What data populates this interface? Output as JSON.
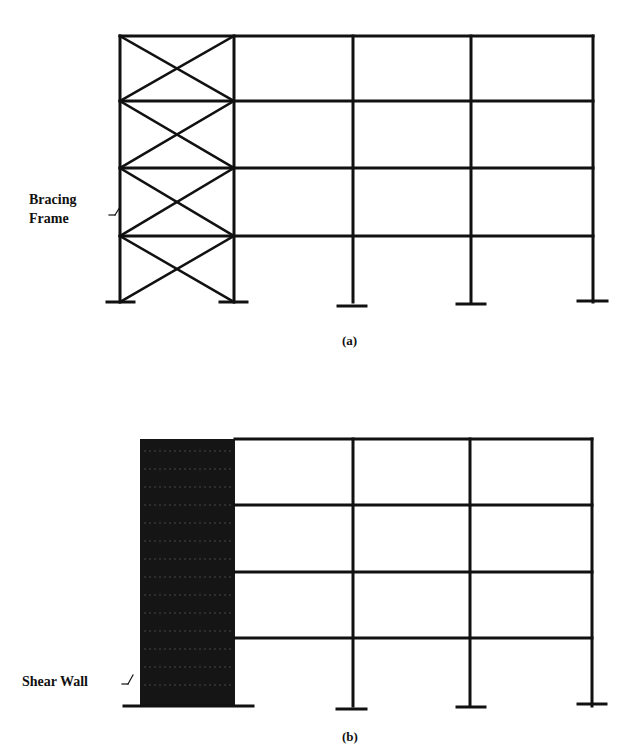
{
  "figure": {
    "stroke_color": "#111111",
    "background": "#ffffff",
    "panel_a": {
      "caption": "(a)",
      "label": {
        "line1": "Bracing",
        "line2": "Frame"
      },
      "system": "Bracing Frame",
      "stories": 4,
      "bays": 4,
      "columns_x": [
        120,
        234,
        353,
        471,
        593
      ],
      "beams_y": [
        36,
        101,
        168,
        236
      ],
      "base_y": 302,
      "braced_bay": {
        "x1": 120,
        "x2": 234
      },
      "footings": [
        {
          "x1": 107,
          "x2": 134,
          "y": 302
        },
        {
          "x1": 220,
          "x2": 247,
          "y": 302
        },
        {
          "x1": 338,
          "x2": 366,
          "y": 306
        },
        {
          "x1": 457,
          "x2": 485,
          "y": 304
        },
        {
          "x1": 578,
          "x2": 607,
          "y": 301
        }
      ],
      "leader": {
        "x1": 115,
        "y1": 215,
        "x2": 120,
        "y2": 207
      }
    },
    "panel_b": {
      "caption": "(b)",
      "label": "Shear Wall",
      "system": "Shear Wall",
      "stories": 4,
      "bays": 3,
      "wall": {
        "x": 140,
        "y": 439,
        "width": 95,
        "height": 267,
        "fill": "#151515"
      },
      "columns_x": [
        353,
        470,
        592
      ],
      "beams_y": [
        439,
        505,
        572,
        638
      ],
      "beam_start_x": 235,
      "base_y": 706,
      "footings": [
        {
          "x1": 124,
          "x2": 253,
          "y": 706
        },
        {
          "x1": 337,
          "x2": 366,
          "y": 709
        },
        {
          "x1": 457,
          "x2": 485,
          "y": 707
        },
        {
          "x1": 578,
          "x2": 606,
          "y": 704
        }
      ],
      "leader": {
        "x1": 128,
        "y1": 684,
        "x2": 133,
        "y2": 675
      }
    }
  }
}
